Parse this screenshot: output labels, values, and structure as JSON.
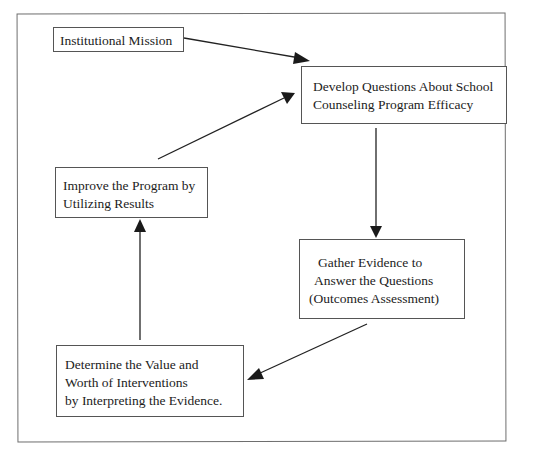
{
  "diagram": {
    "type": "cycle-flowchart",
    "nodes": [
      {
        "id": "mission",
        "lines": [
          "Institutional Mission"
        ]
      },
      {
        "id": "develop",
        "lines": [
          "Develop Questions About School",
          "Counseling Program Efficacy"
        ]
      },
      {
        "id": "gather",
        "lines": [
          "Gather Evidence to",
          "Answer the Questions",
          "(Outcomes Assessment)"
        ]
      },
      {
        "id": "determine",
        "lines": [
          "Determine the Value and",
          "Worth of Interventions",
          "by Interpreting the Evidence."
        ]
      },
      {
        "id": "improve",
        "lines": [
          "Improve the Program by",
          "Utilizing Results"
        ]
      }
    ],
    "edges": [
      {
        "from": "mission",
        "to": "develop"
      },
      {
        "from": "develop",
        "to": "gather"
      },
      {
        "from": "gather",
        "to": "determine"
      },
      {
        "from": "determine",
        "to": "improve"
      },
      {
        "from": "improve",
        "to": "develop"
      }
    ],
    "colors": {
      "line": "#222222",
      "box_border": "#555555",
      "frame_border": "#6e6e6e",
      "background": "#ffffff"
    }
  }
}
